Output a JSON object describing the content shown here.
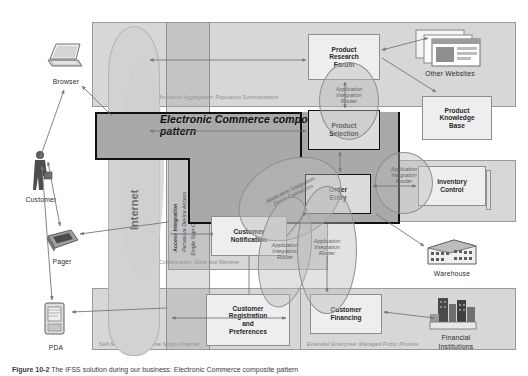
{
  "figure": {
    "caption_prefix": "Figure 10-2",
    "caption_text": "The IFSS solution during our business: Electronic Commerce composite pattern"
  },
  "diagram": {
    "title": "Electronic Commerce composite pattern",
    "business_patterns": [
      {
        "id": "information-aggregation",
        "label": "Information Aggregation: Population Summarization"
      },
      {
        "id": "collaboration",
        "label": "Collaboration: Store and Retrieve"
      },
      {
        "id": "self-service",
        "label": "Self-Service: Stand-Alone Single Channel"
      },
      {
        "id": "extended-enterprise",
        "label": "Extended Enterprise: Managed Public Process"
      }
    ],
    "access_integration": {
      "title": "Access Integration",
      "line1": "Pervasive Device Access",
      "line2": "Single Sign-On & Role-Based Access"
    },
    "application_nodes": [
      {
        "id": "product-research-forum",
        "label": "Product\nResearch\nForum"
      },
      {
        "id": "product-knowledge-base",
        "label": "Product\nKnowledge\nBase"
      },
      {
        "id": "product-selection",
        "label": "Product\nSelection"
      },
      {
        "id": "order-entry",
        "label": "Order\nEntry"
      },
      {
        "id": "inventory-control",
        "label": "Inventory\nControl"
      },
      {
        "id": "customer-notification",
        "label": "Customer\nNotification"
      },
      {
        "id": "customer-registration",
        "label": "Customer\nRegistration\nand\nPreferences"
      },
      {
        "id": "customer-financing",
        "label": "Customer\nFinancing"
      }
    ],
    "integration_ovals": [
      {
        "id": "oval-air-product-selection",
        "line1": "Application",
        "line2": "Integration",
        "line3": "Router"
      },
      {
        "id": "oval-air-inventory",
        "line1": "Application",
        "line2": "Integration",
        "line3": "Router"
      },
      {
        "id": "oval-air-direct",
        "line1": "Application Integration:",
        "line2": "Direct Connection"
      },
      {
        "id": "oval-air-notification",
        "line1": "Application",
        "line2": "Integration",
        "line3": "Router"
      },
      {
        "id": "oval-air-center",
        "line1": "Application",
        "line2": "Integration",
        "line3": "Router"
      }
    ],
    "actors": [
      {
        "id": "browser",
        "label": "Browser"
      },
      {
        "id": "customer",
        "label": "Customer"
      },
      {
        "id": "pager",
        "label": "Pager"
      },
      {
        "id": "pda",
        "label": "PDA"
      },
      {
        "id": "internet",
        "label": "Internet"
      },
      {
        "id": "other-websites",
        "label": "Other Websites"
      },
      {
        "id": "warehouse",
        "label": "Warehouse"
      },
      {
        "id": "financial-institutions",
        "label": "Financial\nInstitutions"
      }
    ],
    "colors": {
      "tile_fill": "#d7d7d7",
      "band_fill": "#a9a9a9",
      "node_fill": "#eeeeee",
      "cloud_fill": "#d2d2d2",
      "stroke": "#8e8e8e",
      "band_stroke": "#111111"
    }
  }
}
